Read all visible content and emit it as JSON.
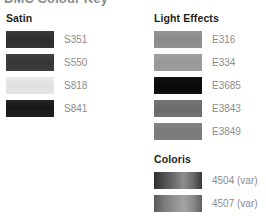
{
  "page": {
    "title": "DMC Colour Key",
    "background": "#ffffff",
    "label_color": "#8c8c8c",
    "heading_color": "#231f20"
  },
  "columns": {
    "left": {
      "sections": [
        {
          "name": "satin",
          "title": "Satin",
          "swatches": [
            {
              "code": "S351",
              "color": "#333333",
              "gradient": "linear-gradient(180deg,#3a3a3a 0%,#2e2e2e 45%,#343434 100%)"
            },
            {
              "code": "S550",
              "color": "#3b3b3b",
              "gradient": "linear-gradient(180deg,#414141 0%,#363636 50%,#3d3d3d 100%)"
            },
            {
              "code": "S818",
              "color": "#e4e4e4",
              "gradient": "linear-gradient(180deg,#eaeaea 0%,#e0e0e0 50%,#e6e6e6 100%)"
            },
            {
              "code": "S841",
              "color": "#1e1e1e",
              "gradient": "linear-gradient(180deg,#242424 0%,#181818 50%,#202020 100%)"
            }
          ]
        }
      ]
    },
    "right": {
      "sections": [
        {
          "name": "light-effects",
          "title": "Light Effects",
          "swatches": [
            {
              "code": "E316",
              "color": "#8e8e8e",
              "gradient": "linear-gradient(180deg,#959595 0%,#8a8a8a 50%,#909090 100%)"
            },
            {
              "code": "E334",
              "color": "#9b9b9b",
              "gradient": "linear-gradient(180deg,#a1a1a1 0%,#979797 50%,#9d9d9d 100%)"
            },
            {
              "code": "E3685",
              "color": "#0d0d0d",
              "gradient": "linear-gradient(180deg,#141414 0%,#090909 50%,#101010 100%)"
            },
            {
              "code": "E3843",
              "color": "#6f6f6f",
              "gradient": "linear-gradient(180deg,#767676 0%,#6b6b6b 50%,#717171 100%)"
            },
            {
              "code": "E3849",
              "color": "#7d7d7d",
              "gradient": "linear-gradient(180deg,#848484 0%,#797979 50%,#7f7f7f 100%)"
            }
          ]
        },
        {
          "name": "coloris",
          "title": "Coloris",
          "swatches": [
            {
              "code": "4504 (var)",
              "color": "#555555",
              "gradient": "linear-gradient(90deg,#2f2f2f 0%,#4a4a4a 18%,#6e6e6e 42%,#8d8d8d 62%,#6a6a6a 82%,#3a3a3a 100%)"
            },
            {
              "code": "4507 (var)",
              "color": "#767676",
              "gradient": "linear-gradient(90deg,#5a5a5a 0%,#7a7a7a 20%,#949494 45%,#a3a3a3 63%,#868686 84%,#606060 100%)"
            }
          ]
        }
      ]
    }
  }
}
